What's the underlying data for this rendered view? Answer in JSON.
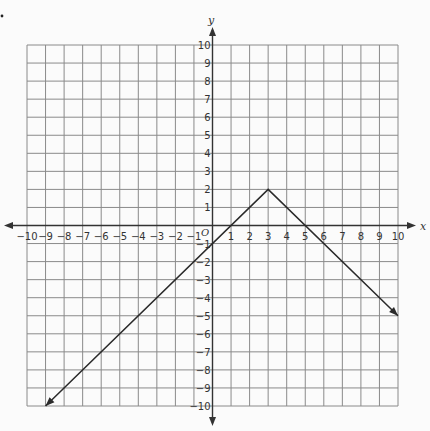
{
  "chart_data": {
    "type": "line",
    "title": "",
    "xlabel": "x",
    "ylabel": "y",
    "origin_label": "O",
    "xlim": [
      -10,
      10
    ],
    "ylim": [
      -10,
      10
    ],
    "grid": true,
    "x_ticks": [
      -10,
      -9,
      -8,
      -7,
      -6,
      -5,
      -4,
      -3,
      -2,
      -1,
      1,
      2,
      3,
      4,
      5,
      6,
      7,
      8,
      9,
      10
    ],
    "y_ticks": [
      10,
      9,
      8,
      7,
      6,
      5,
      4,
      3,
      2,
      1,
      -1,
      -2,
      -3,
      -4,
      -5,
      -6,
      -7,
      -8,
      -9,
      -10
    ],
    "series": [
      {
        "name": "absolute value function",
        "description": "Inverted V graph y = -|x - 3| + 2 with vertex (3, 2); arrows at both ends",
        "x": [
          -9,
          3,
          10
        ],
        "y": [
          -10,
          2,
          -5
        ],
        "vertex": [
          3,
          2
        ],
        "arrows": [
          "start",
          "end"
        ]
      }
    ],
    "legend": null
  },
  "colors": {
    "grid": "#8a8a8a",
    "axis": "#333333",
    "line": "#2a2a2a",
    "background": "#fbfbfb"
  }
}
